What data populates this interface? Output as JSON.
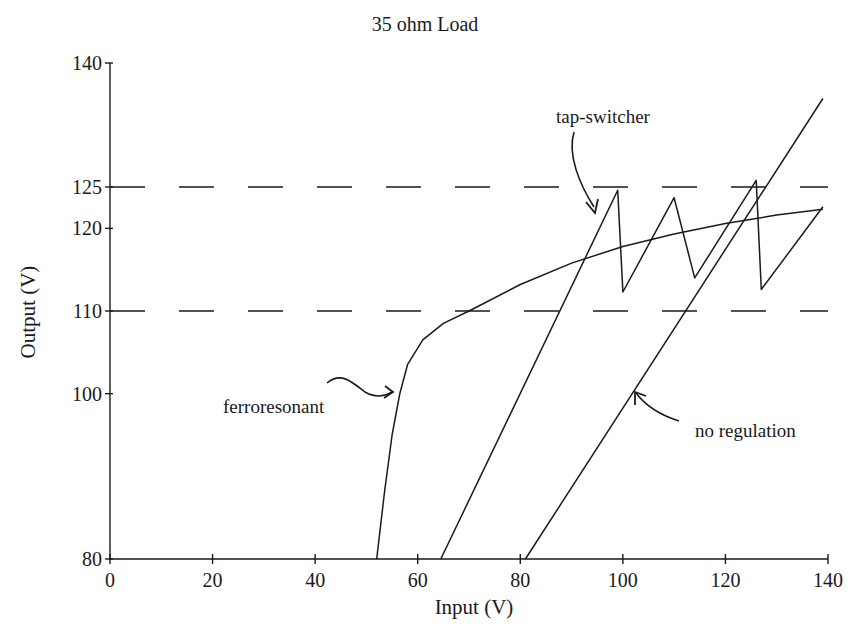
{
  "chart_data": {
    "type": "line",
    "title": "35 ohm Load",
    "xlabel": "Input (V)",
    "ylabel": "Output (V)",
    "xlim": [
      0,
      140
    ],
    "ylim": [
      80,
      140
    ],
    "x_ticks": [
      0,
      20,
      40,
      60,
      80,
      100,
      120,
      140
    ],
    "y_ticks": [
      80,
      100,
      110,
      120,
      125,
      140
    ],
    "grid": false,
    "reference_lines": [
      {
        "y": 125,
        "style": "dashed"
      },
      {
        "y": 110,
        "style": "dashed"
      }
    ],
    "series": [
      {
        "name": "no regulation",
        "points": [
          [
            81,
            80
          ],
          [
            139,
            135.7
          ]
        ]
      },
      {
        "name": "tap-switcher",
        "points": [
          [
            64.5,
            80
          ],
          [
            99,
            124.6
          ],
          [
            100,
            112.3
          ],
          [
            110,
            123.7
          ],
          [
            114,
            114
          ],
          [
            126,
            125.8
          ],
          [
            127,
            112.6
          ],
          [
            139,
            122.6
          ]
        ]
      },
      {
        "name": "ferroresonant",
        "points": [
          [
            52,
            80
          ],
          [
            53.5,
            88
          ],
          [
            55,
            95
          ],
          [
            56.5,
            100
          ],
          [
            58,
            103.5
          ],
          [
            61,
            106.5
          ],
          [
            65,
            108.5
          ],
          [
            70,
            110
          ],
          [
            80,
            113.2
          ],
          [
            90,
            115.8
          ],
          [
            100,
            117.8
          ],
          [
            110,
            119.3
          ],
          [
            120,
            120.6
          ],
          [
            130,
            121.6
          ],
          [
            139,
            122.3
          ]
        ]
      }
    ],
    "annotations": [
      {
        "text": "tap-switcher",
        "arrow_to": [
          95,
          121
        ]
      },
      {
        "text": "ferroresonant",
        "arrow_to": [
          56.5,
          100
        ]
      },
      {
        "text": "no regulation",
        "arrow_to": [
          103,
          100
        ]
      }
    ]
  },
  "labels": {
    "title": "35 ohm Load",
    "xlabel": "Input (V)",
    "ylabel": "Output (V)",
    "x_ticks": [
      "0",
      "20",
      "40",
      "60",
      "80",
      "100",
      "120",
      "140"
    ],
    "y_ticks": [
      "80",
      "100",
      "110",
      "120",
      "125",
      "140"
    ],
    "annotation_tap": "tap-switcher",
    "annotation_ferro": "ferroresonant",
    "annotation_noreg": "no regulation"
  },
  "colors": {
    "ink": "#1a1a1a",
    "background": "#ffffff"
  }
}
